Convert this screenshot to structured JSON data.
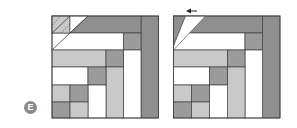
{
  "figure": {
    "label": "E",
    "colors": {
      "white": "#ffffff",
      "light": "#c9c9c9",
      "medium": "#9b9b9b",
      "dark": "#8f8f8f",
      "line": "#3f3f3f",
      "badge": "#8a8a8a",
      "arrow": "#222222"
    },
    "grid": {
      "rows_y": [
        16,
        33,
        50,
        67,
        85,
        102,
        118
      ],
      "cols_offset": [
        0,
        18,
        36,
        54,
        71.5,
        89,
        106.5
      ]
    },
    "blocks": [
      {
        "name": "left-block",
        "x": 52,
        "variant": "before"
      },
      {
        "name": "right-block",
        "x": 173.5,
        "variant": "after"
      }
    ],
    "arrow": {
      "direction": "left",
      "x1": 197,
      "x2": 186,
      "y": 11
    }
  }
}
